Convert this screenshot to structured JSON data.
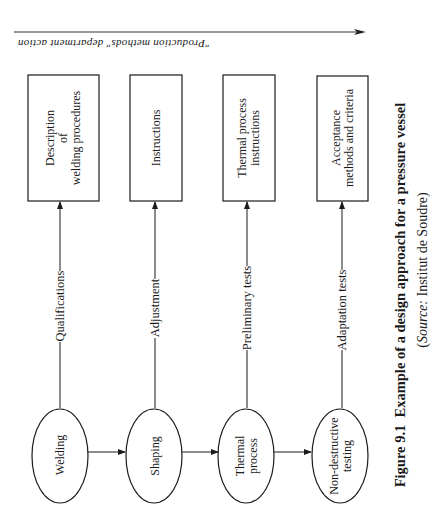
{
  "figure": {
    "number": "Figure 9.1",
    "title": "Example of a design approach for a pressure vessel",
    "source_label": "Source:",
    "source_text": "Institut de Soudre",
    "orientation": "rotated 90° counter-clockwise"
  },
  "top_arrow": {
    "label": "\"Production methods\" department action",
    "label_orientation": "upside-down"
  },
  "process_steps": [
    {
      "id": "welding",
      "label_lines": [
        "Welding"
      ],
      "shape": "ellipse"
    },
    {
      "id": "shaping",
      "label_lines": [
        "Shaping"
      ],
      "shape": "ellipse"
    },
    {
      "id": "thermal",
      "label_lines": [
        "Thermal",
        "process"
      ],
      "shape": "ellipse"
    },
    {
      "id": "ndt",
      "label_lines": [
        "Non-destructive",
        "testing"
      ],
      "shape": "ellipse"
    }
  ],
  "connectors": [
    {
      "from": "welding",
      "label": "Qualifications",
      "to": "box-welding"
    },
    {
      "from": "shaping",
      "label": "Adjustment",
      "to": "box-shaping"
    },
    {
      "from": "thermal",
      "label": "Preliminary tests",
      "to": "box-thermal"
    },
    {
      "from": "ndt",
      "label": "Adaptation tests",
      "to": "box-ndt"
    }
  ],
  "outputs": [
    {
      "id": "box-welding",
      "label_lines": [
        "Description",
        "of",
        "welding procedures"
      ],
      "shape": "rectangle"
    },
    {
      "id": "box-shaping",
      "label_lines": [
        "Instructions"
      ],
      "shape": "rectangle"
    },
    {
      "id": "box-thermal",
      "label_lines": [
        "Thermal process",
        "instructions"
      ],
      "shape": "rectangle"
    },
    {
      "id": "box-ndt",
      "label_lines": [
        "Acceptance",
        "methods and criteria"
      ],
      "shape": "rectangle"
    }
  ],
  "flow": [
    "welding",
    "shaping",
    "thermal",
    "ndt"
  ]
}
